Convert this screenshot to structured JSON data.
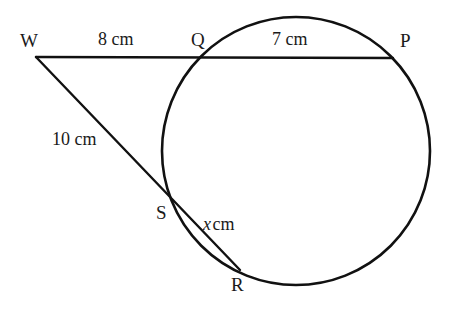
{
  "figure": {
    "background_color": "#ffffff",
    "stroke_color": "#111111",
    "width": 465,
    "height": 309
  },
  "points": {
    "W": {
      "label": "W",
      "x": 36,
      "y": 57,
      "role": "external-vertex"
    },
    "Q": {
      "label": "Q",
      "x": 208,
      "y": 58,
      "role": "circle-intersection-near"
    },
    "P": {
      "label": "P",
      "x": 393,
      "y": 58,
      "role": "circle-intersection-far"
    },
    "S": {
      "label": "S",
      "x": 176,
      "y": 205,
      "role": "circle-intersection-near"
    },
    "R": {
      "label": "R",
      "x": 240,
      "y": 270,
      "role": "circle-intersection-far"
    }
  },
  "measures": {
    "WQ": {
      "text": "8 cm",
      "value": 8,
      "unit": "cm",
      "segment": "WQ"
    },
    "QP": {
      "text": "7 cm",
      "value": 7,
      "unit": "cm",
      "segment": "QP"
    },
    "WS": {
      "text": "10 cm",
      "value": 10,
      "unit": "cm",
      "segment": "WS"
    },
    "SR": {
      "variable": "x",
      "unit": "cm",
      "text": "cm",
      "segment": "SR"
    }
  },
  "circle": {
    "cx": 296,
    "cy": 151,
    "r": 134,
    "stroke_width": 2.6
  },
  "segments": [
    {
      "name": "secant-WQP",
      "from": "W",
      "to": "P",
      "stroke_width": 2.4
    },
    {
      "name": "secant-WSR",
      "from": "W",
      "to": "R",
      "stroke_width": 2.4
    }
  ]
}
